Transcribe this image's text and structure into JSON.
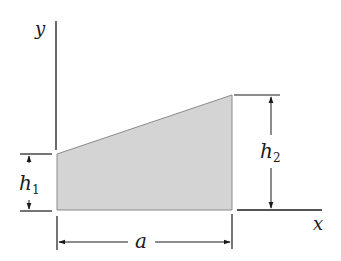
{
  "diagram": {
    "type": "trapezoidal area with dimensions",
    "axes": {
      "x_label": "x",
      "y_label": "y"
    },
    "shape": {
      "fill_color": "#d4d4d4",
      "edge_color": "#8a8a8a",
      "description": "trapezoid with vertical left edge h1, vertical right edge h2, base a along x-axis"
    },
    "dimensions": {
      "h1": {
        "base": "h",
        "sub": "1"
      },
      "h2": {
        "base": "h",
        "sub": "2"
      },
      "a": {
        "label": "a"
      }
    },
    "colors": {
      "line": "#1a1a1a",
      "fill": "#d4d4d4"
    }
  }
}
